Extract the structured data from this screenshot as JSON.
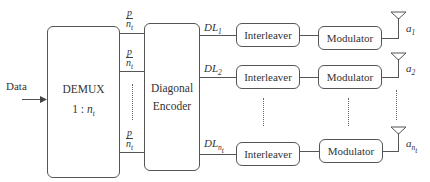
{
  "input": {
    "label": "Data"
  },
  "demux": {
    "title": "DEMUX",
    "ratio_prefix": "1 : ",
    "ratio_var": "n",
    "ratio_sub": "t"
  },
  "encoder": {
    "line1": "Diagonal",
    "line2": "Encoder"
  },
  "streams": {
    "fraction_num": "p",
    "fraction_den": "n",
    "fraction_den_sub": "t"
  },
  "rows": [
    {
      "dl": "DL",
      "dl_sub": "1",
      "interleaver": "Interleaver",
      "modulator": "Modulator",
      "antenna": "a",
      "antenna_sub": "1"
    },
    {
      "dl": "DL",
      "dl_sub": "2",
      "interleaver": "Interleaver",
      "modulator": "Modulator",
      "antenna": "a",
      "antenna_sub": "2"
    },
    {
      "dl": "DL",
      "dl_sub": "n",
      "dl_sub2": "t",
      "interleaver": "Interleaver",
      "modulator": "Modulator",
      "antenna": "a",
      "antenna_sub": "n",
      "antenna_sub2": "t"
    }
  ]
}
